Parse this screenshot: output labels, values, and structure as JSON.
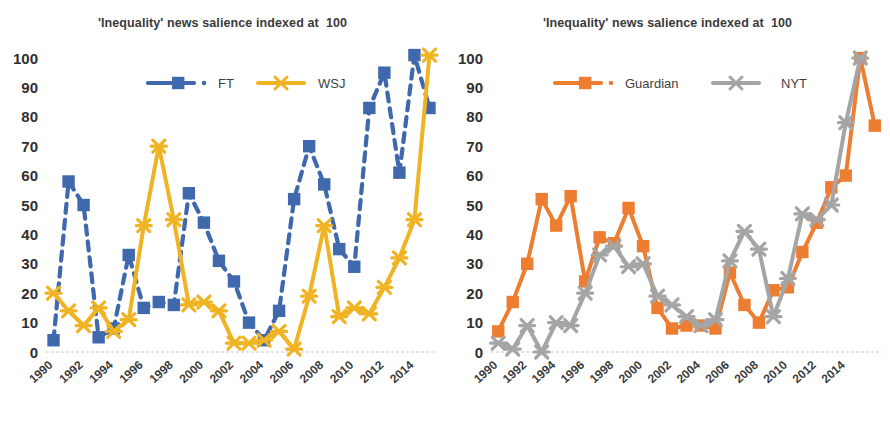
{
  "page": {
    "background": "#ffffff",
    "width": 890,
    "height": 422
  },
  "charts": [
    {
      "id": "left",
      "title": "'Inequality' news salience indexed at  100",
      "legend": [
        {
          "name": "FT",
          "label": "FT",
          "color": "#3f68ad",
          "marker": "square",
          "line": "dashed"
        },
        {
          "name": "WSJ",
          "label": "WSJ",
          "color": "#f0b323",
          "marker": "x",
          "line": "solid"
        }
      ],
      "axis": {
        "y_ticks": [
          "0",
          "10",
          "20",
          "30",
          "40",
          "50",
          "60",
          "70",
          "80",
          "90",
          "100"
        ],
        "y_min": 0,
        "y_max": 100,
        "x_ticks": [
          "1990",
          "1992",
          "1994",
          "1996",
          "1998",
          "2000",
          "2002",
          "2004",
          "2006",
          "2008",
          "2010",
          "2012",
          "2014"
        ],
        "grid": false
      }
    },
    {
      "id": "right",
      "title": "'Inequality' news salience indexed at  100",
      "legend": [
        {
          "name": "Guardian",
          "label": "Guardian",
          "color": "#ed7d31",
          "marker": "square",
          "line": "solid"
        },
        {
          "name": "NYT",
          "label": "NYT",
          "color": "#a5a5a5",
          "marker": "x",
          "line": "solid"
        }
      ],
      "axis": {
        "y_ticks": [
          "0",
          "10",
          "20",
          "30",
          "40",
          "50",
          "60",
          "70",
          "80",
          "90",
          "100"
        ],
        "y_min": 0,
        "y_max": 100,
        "x_ticks": [
          "1990",
          "1992",
          "1994",
          "1996",
          "1998",
          "2000",
          "2002",
          "2004",
          "2006",
          "2008",
          "2010",
          "2012",
          "2014"
        ],
        "grid": false
      }
    }
  ],
  "chart_data": [
    {
      "type": "line",
      "id": "left-panel",
      "title": "'Inequality' news salience indexed at  100",
      "xlabel": "",
      "ylabel": "",
      "ylim": [
        0,
        100
      ],
      "xlim": [
        1990,
        2015
      ],
      "grid": false,
      "legend_position": "top-center",
      "x": [
        1990,
        1991,
        1992,
        1993,
        1994,
        1995,
        1996,
        1997,
        1998,
        1999,
        2000,
        2001,
        2002,
        2003,
        2004,
        2005,
        2006,
        2007,
        2008,
        2009,
        2010,
        2011,
        2012,
        2013,
        2014,
        2015
      ],
      "series": [
        {
          "name": "FT",
          "color": "#3f68ad",
          "values": [
            4,
            58,
            50,
            5,
            8,
            33,
            15,
            17,
            16,
            54,
            44,
            31,
            24,
            10,
            4,
            14,
            52,
            70,
            57,
            35,
            29,
            83,
            95,
            61,
            101,
            83
          ]
        },
        {
          "name": "WSJ",
          "color": "#f0b323",
          "values": [
            20,
            14,
            9,
            15,
            7,
            11,
            43,
            70,
            45,
            16,
            17,
            14,
            3,
            3,
            4,
            7,
            1,
            19,
            43,
            12,
            15,
            13,
            22,
            32,
            45,
            101
          ]
        }
      ]
    },
    {
      "type": "line",
      "id": "right-panel",
      "title": "'Inequality' news salience indexed at  100",
      "xlabel": "",
      "ylabel": "",
      "ylim": [
        0,
        100
      ],
      "xlim": [
        1990,
        2015
      ],
      "grid": false,
      "legend_position": "top-center",
      "x": [
        1990,
        1991,
        1992,
        1993,
        1994,
        1995,
        1996,
        1997,
        1998,
        1999,
        2000,
        2001,
        2002,
        2003,
        2004,
        2005,
        2006,
        2007,
        2008,
        2009,
        2010,
        2011,
        2012,
        2013,
        2014,
        2015
      ],
      "series": [
        {
          "name": "Guardian",
          "color": "#ed7d31",
          "values": [
            7,
            17,
            30,
            52,
            43,
            53,
            24,
            39,
            37,
            49,
            36,
            15,
            8,
            9,
            9,
            8,
            27,
            16,
            10,
            21,
            22,
            34,
            44,
            56,
            60,
            100,
            77
          ]
        },
        {
          "name": "NYT",
          "color": "#a5a5a5",
          "values": [
            3,
            1,
            9,
            0,
            10,
            9,
            20,
            33,
            36,
            29,
            30,
            19,
            16,
            12,
            9,
            11,
            31,
            41,
            35,
            12,
            25,
            47,
            45,
            50,
            78,
            100
          ]
        }
      ]
    }
  ]
}
